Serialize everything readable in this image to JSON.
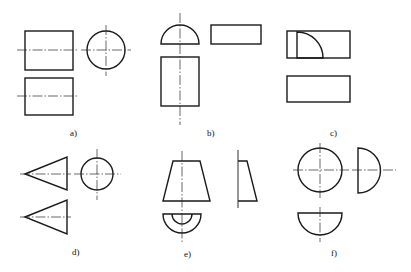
{
  "figure": {
    "panels": [
      {
        "id": "a",
        "label": "a)",
        "solid": "cylinder (axis horizontal)",
        "views": [
          "rectangle",
          "circle",
          "rectangle"
        ]
      },
      {
        "id": "b",
        "label": "b)",
        "solid": "half cylinder",
        "views": [
          "semicircle",
          "rectangle",
          "rectangle"
        ]
      },
      {
        "id": "c",
        "label": "c)",
        "solid": "quarter cylinder",
        "views": [
          "rectangle",
          "quarter circle",
          "rectangle"
        ]
      },
      {
        "id": "d",
        "label": "d)",
        "solid": "cone (axis horizontal)",
        "views": [
          "triangle",
          "circle",
          "triangle"
        ]
      },
      {
        "id": "e",
        "label": "e)",
        "solid": "half truncated cone",
        "views": [
          "trapezoid",
          "right trapezoid",
          "half annulus"
        ]
      },
      {
        "id": "f",
        "label": "f)",
        "solid": "hemisphere",
        "views": [
          "circle",
          "semicircle",
          "semicircle"
        ]
      }
    ]
  },
  "colors": {
    "line": "#1a1a1a",
    "background": "#ffffff"
  }
}
